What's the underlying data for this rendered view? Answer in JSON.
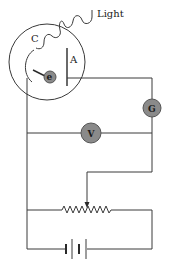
{
  "diagram": {
    "labels": {
      "light": "Light",
      "cathode": "C",
      "anode": "A",
      "electron": "e",
      "galvanometer": "G",
      "voltmeter": "V"
    },
    "components": [
      {
        "id": "photocell",
        "type": "vacuum-tube",
        "contains": [
          "cathode",
          "anode"
        ]
      },
      {
        "id": "cathode",
        "label": "C"
      },
      {
        "id": "anode",
        "label": "A"
      },
      {
        "id": "electron",
        "label": "e"
      },
      {
        "id": "galvanometer",
        "label": "G"
      },
      {
        "id": "voltmeter",
        "label": "V"
      },
      {
        "id": "rheostat",
        "type": "variable-resistor"
      },
      {
        "id": "battery",
        "type": "dc-source"
      }
    ],
    "colors": {
      "meter_fill": "#8a8a8a",
      "line": "#3a3a3a",
      "background": "#ffffff"
    }
  }
}
